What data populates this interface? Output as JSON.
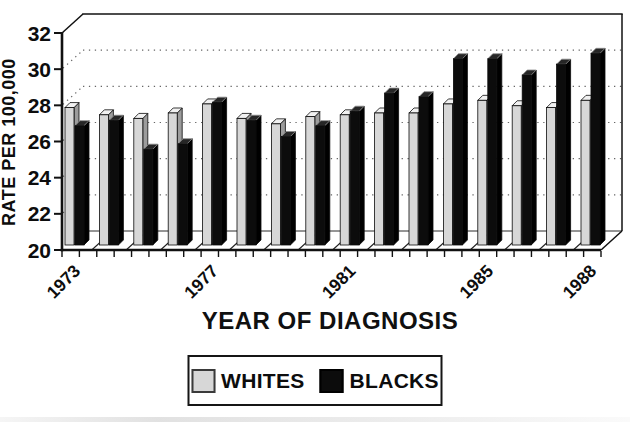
{
  "chart_data": {
    "type": "bar",
    "style": "3d-paired-columns",
    "title": "",
    "xlabel": "YEAR OF DIAGNOSIS",
    "ylabel": "RATE PER 100,000",
    "ylim": [
      20,
      32
    ],
    "yticks": [
      20,
      22,
      24,
      26,
      28,
      30,
      32
    ],
    "grid": "dotted horizontal gridlines at 22, 24, 26, 28, 30 on back wall",
    "legend_position": "boxed, centered below x-axis title",
    "categories": [
      "1973",
      "1974",
      "1975",
      "1976",
      "1977",
      "1978",
      "1979",
      "1980",
      "1981",
      "1982",
      "1983",
      "1984",
      "1985",
      "1986",
      "1987",
      "1988"
    ],
    "visible_x_tick_labels": [
      "1973",
      "1977",
      "1981",
      "1985",
      "1988"
    ],
    "series": [
      {
        "name": "WHITES",
        "color": "#d7d7d7",
        "values": [
          27.6,
          27.2,
          27.0,
          27.3,
          27.8,
          27.0,
          26.7,
          27.1,
          27.2,
          27.3,
          27.3,
          27.8,
          28.0,
          27.7,
          27.6,
          28.0
        ]
      },
      {
        "name": "BLACKS",
        "color": "#0c0c0c",
        "values": [
          26.6,
          26.9,
          25.3,
          25.6,
          27.9,
          26.9,
          26.0,
          26.6,
          27.4,
          28.4,
          28.2,
          30.3,
          30.3,
          29.4,
          30.0,
          30.6
        ]
      }
    ]
  },
  "colors": {
    "background": "#ffffff",
    "axis": "#111111",
    "grid_dots": "#666666",
    "whites_bar": "#d7d7d7",
    "blacks_bar": "#0c0c0c"
  }
}
